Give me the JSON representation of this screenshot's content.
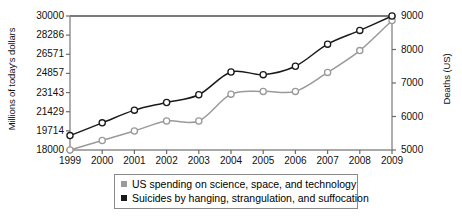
{
  "chart_data": {
    "type": "line",
    "title": "",
    "xlabel": "",
    "categories": [
      1999,
      2000,
      2001,
      2002,
      2003,
      2004,
      2005,
      2006,
      2007,
      2008,
      2009
    ],
    "x_tick_labels": [
      "1999",
      "2000",
      "2001",
      "2002",
      "2003",
      "2004",
      "2005",
      "2006",
      "2007",
      "2008",
      "2009"
    ],
    "grid": false,
    "legend_position": "bottom",
    "axes": {
      "left": {
        "label": "Millions of today's dollars",
        "ylim": [
          18000,
          30000
        ],
        "ticks": [
          18000,
          19714,
          21429,
          23143,
          24857,
          26571,
          28286,
          30000
        ],
        "tick_labels": [
          "18000",
          "19714",
          "21429",
          "23143",
          "24857",
          "26571",
          "28286",
          "30000"
        ]
      },
      "right": {
        "label": "Deaths (US)",
        "ylim": [
          5000,
          9000
        ],
        "ticks": [
          5000,
          6000,
          7000,
          8000,
          9000
        ],
        "tick_labels": [
          "5000",
          "6000",
          "7000",
          "8000",
          "9000"
        ]
      }
    },
    "series": [
      {
        "name": "US spending on science, space, and technology",
        "axis": "left",
        "color": "#9a9a9a",
        "marker": "open-circle",
        "values": [
          18000,
          18850,
          19700,
          20600,
          20600,
          23000,
          23250,
          23250,
          24950,
          26900,
          29600
        ]
      },
      {
        "name": "Suicides by hanging, strangulation, and suffocation",
        "axis": "right",
        "color": "#1a1a1a",
        "marker": "open-circle",
        "values": [
          5430,
          5810,
          6190,
          6420,
          6650,
          7330,
          7250,
          7500,
          8160,
          8570,
          9000
        ]
      }
    ]
  },
  "legend": {
    "items": [
      {
        "label": "US spending on science, space, and technology",
        "color": "#9a9a9a"
      },
      {
        "label": "Suicides by hanging, strangulation, and suffocation",
        "color": "#1a1a1a"
      }
    ]
  }
}
